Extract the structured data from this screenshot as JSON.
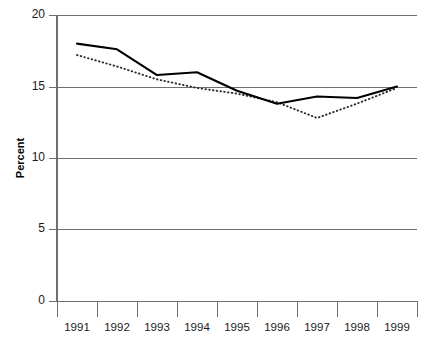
{
  "chart_data": {
    "type": "line",
    "title": "",
    "subtitle": "",
    "xlabel": "",
    "ylabel": "Percent",
    "categories": [
      "1991",
      "1992",
      "1993",
      "1994",
      "1995",
      "1996",
      "1997",
      "1998",
      "1999"
    ],
    "ylim": [
      0,
      20
    ],
    "yticks": [
      0,
      5,
      10,
      15,
      20
    ],
    "ytick_labels": [
      "0",
      "5",
      "10",
      "15",
      "20"
    ],
    "grid": true,
    "grid_axis": "y",
    "legend": null,
    "legend_position": "none",
    "series": [
      {
        "name": "solid-series",
        "style": "solid",
        "color": "#000000",
        "values": [
          18.0,
          17.6,
          15.8,
          16.0,
          14.7,
          13.8,
          14.3,
          14.2,
          15.0
        ]
      },
      {
        "name": "dotted-series",
        "style": "dotted",
        "color": "#2b2b2b",
        "values": [
          17.2,
          16.4,
          15.5,
          14.9,
          14.5,
          13.9,
          12.8,
          13.8,
          14.9
        ]
      }
    ]
  },
  "axes": {
    "y_axis_title": "Percent",
    "y_tick_0": "0",
    "y_tick_1": "5",
    "y_tick_2": "10",
    "y_tick_3": "15",
    "y_tick_4": "20",
    "x_tick_0": "1991",
    "x_tick_1": "1992",
    "x_tick_2": "1993",
    "x_tick_3": "1994",
    "x_tick_4": "1995",
    "x_tick_5": "1996",
    "x_tick_6": "1997",
    "x_tick_7": "1998",
    "x_tick_8": "1999"
  },
  "colors": {
    "background": "#ffffff",
    "axis": "#6f6f6f",
    "text": "#1a1a1a",
    "series_solid": "#000000",
    "series_dotted": "#2b2b2b"
  }
}
